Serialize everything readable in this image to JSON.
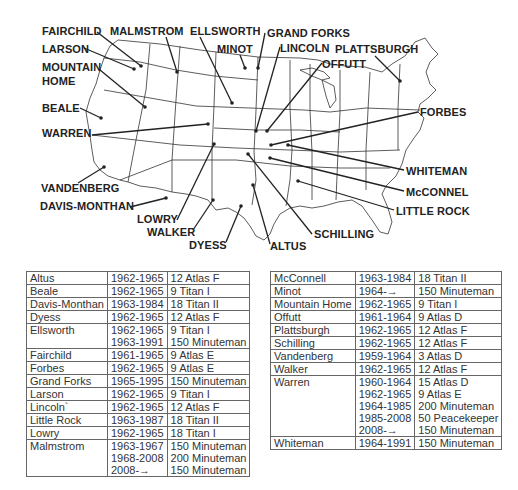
{
  "map": {
    "labels": [
      {
        "name": "FAIRCHILD",
        "x": 42,
        "y": 25,
        "dot": [
          141,
          66
        ],
        "anchor": [
          97,
          32
        ]
      },
      {
        "name": "MALMSTROM",
        "x": 110,
        "y": 25,
        "dot": [
          177,
          72
        ],
        "anchor": [
          166,
          37
        ]
      },
      {
        "name": "ELLSWORTH",
        "x": 190,
        "y": 25,
        "dot": [
          232,
          103
        ],
        "anchor": [
          200,
          37
        ]
      },
      {
        "name": "GRAND FORKS",
        "x": 267,
        "y": 27,
        "dot": [
          258,
          68
        ],
        "anchor": [
          265,
          33
        ]
      },
      {
        "name": "LARSON",
        "x": 42,
        "y": 43,
        "dot": [
          134,
          69
        ],
        "anchor": [
          84,
          48
        ]
      },
      {
        "name": "MINOT",
        "x": 217,
        "y": 43,
        "dot": [
          245,
          68
        ],
        "anchor": [
          240,
          55
        ]
      },
      {
        "name": "LINCOLN",
        "x": 280,
        "y": 42,
        "dot": [
          256,
          131
        ],
        "anchor": [
          280,
          47
        ]
      },
      {
        "name": "PLATTSBURGH",
        "x": 335,
        "y": 43,
        "dot": [
          400,
          81
        ],
        "anchor": [
          375,
          56
        ]
      },
      {
        "name": "OFFUTT",
        "x": 322,
        "y": 58,
        "dot": [
          267,
          131
        ],
        "anchor": [
          322,
          63
        ]
      },
      {
        "name": "MOUNTAIN",
        "x": 42,
        "y": 61,
        "dot": [
          145,
          107
        ],
        "anchor": [
          100,
          70
        ]
      },
      {
        "name": "HOME",
        "x": 42,
        "y": 75,
        "dot": null,
        "anchor": null
      },
      {
        "name": "BEALE",
        "x": 42,
        "y": 102,
        "dot": [
          101,
          118
        ],
        "anchor": [
          80,
          108
        ]
      },
      {
        "name": "FORBES",
        "x": 420,
        "y": 106,
        "dot": [
          271,
          145
        ],
        "anchor": [
          418,
          112
        ]
      },
      {
        "name": "WARREN",
        "x": 42,
        "y": 127,
        "dot": [
          208,
          124
        ],
        "anchor": [
          92,
          135
        ]
      },
      {
        "name": "WHITEMAN",
        "x": 406,
        "y": 165,
        "dot": [
          288,
          145
        ],
        "anchor": [
          404,
          170
        ]
      },
      {
        "name": "VANDENBERG",
        "x": 41,
        "y": 182,
        "dot": [
          104,
          167
        ],
        "anchor": [
          78,
          183
        ]
      },
      {
        "name": "McCONNEL",
        "x": 406,
        "y": 186,
        "dot": [
          270,
          158
        ],
        "anchor": [
          404,
          191
        ]
      },
      {
        "name": "DAVIS-MONTHAN",
        "x": 40,
        "y": 200,
        "dot": [
          166,
          198
        ],
        "anchor": [
          130,
          207
        ]
      },
      {
        "name": "LITTLE ROCK",
        "x": 396,
        "y": 205,
        "dot": [
          298,
          181
        ],
        "anchor": [
          394,
          210
        ]
      },
      {
        "name": "LOWRY",
        "x": 137,
        "y": 213,
        "dot": [
          214,
          144
        ],
        "anchor": [
          177,
          220
        ]
      },
      {
        "name": "WALKER",
        "x": 147,
        "y": 226,
        "dot": [
          213,
          200
        ],
        "anchor": [
          193,
          230
        ]
      },
      {
        "name": "SCHILLING",
        "x": 314,
        "y": 228,
        "dot": [
          248,
          154
        ],
        "anchor": [
          312,
          234
        ]
      },
      {
        "name": "DYESS",
        "x": 189,
        "y": 239,
        "dot": [
          241,
          206
        ],
        "anchor": [
          226,
          242
        ]
      },
      {
        "name": "ALTUS",
        "x": 270,
        "y": 240,
        "dot": [
          253,
          185
        ],
        "anchor": [
          270,
          244
        ]
      }
    ]
  },
  "tables": {
    "left": [
      {
        "base": "Altus",
        "years": [
          "1962-1965"
        ],
        "missiles": [
          "12 Atlas F"
        ]
      },
      {
        "base": "Beale",
        "years": [
          "1962-1965"
        ],
        "missiles": [
          "9 Titan I"
        ]
      },
      {
        "base": "Davis-Monthan",
        "years": [
          "1963-1984"
        ],
        "missiles": [
          "18 Titan II"
        ]
      },
      {
        "base": "Dyess",
        "years": [
          "1962-1965"
        ],
        "missiles": [
          "12 Atlas F"
        ]
      },
      {
        "base": "Ellsworth",
        "years": [
          "1962-1965",
          "1963-1991"
        ],
        "missiles": [
          "9 Titan I",
          "150 Minuteman"
        ]
      },
      {
        "base": "Fairchild",
        "years": [
          "1961-1965"
        ],
        "missiles": [
          "9 Atlas E"
        ]
      },
      {
        "base": "Forbes",
        "years": [
          "1962-1965"
        ],
        "missiles": [
          "9 Atlas E"
        ]
      },
      {
        "base": "Grand Forks",
        "years": [
          "1965-1995"
        ],
        "missiles": [
          "150 Minuteman"
        ]
      },
      {
        "base": "Larson",
        "years": [
          "1962-1965"
        ],
        "missiles": [
          "9 Titan I"
        ]
      },
      {
        "base": "Lincoln`",
        "years": [
          "1962-1965"
        ],
        "missiles": [
          "12 Atlas F"
        ]
      },
      {
        "base": "Little Rock",
        "years": [
          "1963-1987"
        ],
        "missiles": [
          "18 Titan II"
        ]
      },
      {
        "base": "Lowry",
        "years": [
          "1962-1965"
        ],
        "missiles": [
          "18 Titan I"
        ]
      },
      {
        "base": "Malmstrom",
        "years": [
          "1963-1967",
          "1968-2008",
          "2008-→"
        ],
        "missiles": [
          "150 Minuteman",
          "200 Minuteman",
          "150 Minuteman"
        ]
      }
    ],
    "right": [
      {
        "base": "McConnell",
        "years": [
          "1963-1984"
        ],
        "missiles": [
          "18 Titan II"
        ]
      },
      {
        "base": "Minot",
        "years": [
          "1964-→"
        ],
        "missiles": [
          "150 Minuteman"
        ]
      },
      {
        "base": "Mountain Home",
        "years": [
          "1962-1965"
        ],
        "missiles": [
          "9 Titan I"
        ]
      },
      {
        "base": "Offutt",
        "years": [
          "1961-1964"
        ],
        "missiles": [
          "9 Atlas D"
        ]
      },
      {
        "base": "Plattsburgh",
        "years": [
          "1962-1965"
        ],
        "missiles": [
          "12 Atlas F"
        ]
      },
      {
        "base": "Schilling",
        "years": [
          "1962-1965"
        ],
        "missiles": [
          "12 Atlas F"
        ]
      },
      {
        "base": "Vandenberg",
        "years": [
          "1959-1964"
        ],
        "missiles": [
          "3 Atlas D"
        ]
      },
      {
        "base": "Walker",
        "years": [
          "1962-1965"
        ],
        "missiles": [
          "12 Atlas F"
        ]
      },
      {
        "base": "Warren",
        "years": [
          "1960-1964",
          "1962-1965",
          "1964-1985",
          "1985-2008",
          "2008-→"
        ],
        "missiles": [
          "15 Atlas D",
          "9 Atlas E",
          "200 Minuteman",
          "50 Peacekeeper",
          "150 Minuteman"
        ]
      },
      {
        "base": "Whiteman",
        "years": [
          "1964-1991"
        ],
        "missiles": [
          "150 Minuteman"
        ]
      }
    ]
  }
}
